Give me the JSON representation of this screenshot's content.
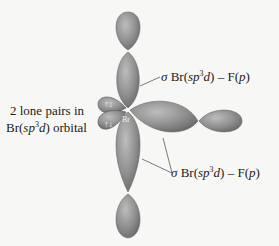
{
  "diagram": {
    "type": "orbital-diagram",
    "central_atom": "Br",
    "labels": {
      "lone_pairs_line1": "2 lone pairs in",
      "lone_pairs_line2_prefix": "Br(",
      "lone_pairs_line2_hyb": "sp",
      "lone_pairs_line2_sup": "3",
      "lone_pairs_line2_d": "d",
      "lone_pairs_line2_suffix": ") orbital",
      "sigma_bond_top": {
        "sigma": "σ",
        "text_a": " Br(",
        "hyb": "sp",
        "sup": "3",
        "d": "d",
        "text_b": ") – F(",
        "p": "p",
        "text_c": ")"
      },
      "sigma_bond_bottom": {
        "sigma": "σ",
        "text_a": " Br(",
        "hyb": "sp",
        "sup": "3",
        "d": "d",
        "text_b": ") – F(",
        "p": "p",
        "text_c": ")"
      },
      "center_atom_label": "Br",
      "electron_arrows": [
        "↑↓",
        "↑↓"
      ]
    },
    "colors": {
      "lobe_fill": "#8c8c8c",
      "lobe_stroke": "#5a5a5a",
      "background": "#f7f7f5",
      "text": "#222222"
    }
  }
}
